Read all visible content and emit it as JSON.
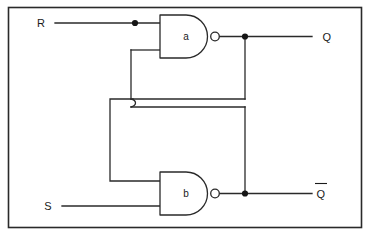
{
  "diagram": {
    "type": "logic-circuit-schematic",
    "colors": {
      "line": "#2a2a2a",
      "background": "#ffffff",
      "junction": "#151515",
      "text": "#1a1a1a"
    },
    "frame": {
      "x": 8,
      "y": 7,
      "width": 354,
      "height": 221
    },
    "labels": {
      "input_r": "R",
      "input_s": "S",
      "output_q": "Q",
      "output_qbar": "Q",
      "output_qbar_overbar": true,
      "gate_a": "a",
      "gate_b": "b"
    },
    "gates": [
      {
        "name": "a",
        "label": "a",
        "kind": "NAND",
        "body": {
          "x": 160,
          "y": 15,
          "width": 52,
          "height": 43
        },
        "bubble": {
          "cx": 215,
          "cy": 36.5,
          "r": 4.3
        },
        "inputs": [
          {
            "name": "gate-a-input-top",
            "y": 23
          },
          {
            "name": "gate-a-input-bottom",
            "y": 50
          }
        ],
        "output": {
          "x": 219,
          "y": 36.5
        }
      },
      {
        "name": "b",
        "label": "b",
        "kind": "NAND",
        "body": {
          "x": 160,
          "y": 172,
          "width": 52,
          "height": 43
        },
        "bubble": {
          "cx": 215,
          "cy": 193.5,
          "r": 4.3
        },
        "inputs": [
          {
            "name": "gate-b-input-top",
            "y": 181
          },
          {
            "name": "gate-b-input-bottom",
            "y": 206
          }
        ],
        "output": {
          "x": 219,
          "y": 193.5
        }
      }
    ],
    "junctions": [
      {
        "name": "junction-r-input",
        "cx": 135,
        "cy": 23,
        "r": 3.0
      },
      {
        "name": "junction-q-output",
        "cx": 245,
        "cy": 36.5,
        "r": 3.0
      },
      {
        "name": "junction-qbar-output",
        "cx": 245,
        "cy": 193.5,
        "r": 3.0
      }
    ],
    "wires": {
      "r_input_line": "M 55 23 L 160 23",
      "s_input_line": "M 62 206 L 160 206",
      "q_output_line": "M 219 36.5 L 310 36.5",
      "qbar_output_line": "M 219 193.5 L 310 193.5",
      "gate_a_lower_input_stub": "M 131 50 L 160 50",
      "gate_a_feedback_down": "M 131 50 L 131 99",
      "gate_a_feedback_jog": "M 131 99 L 135 103 L 131 107",
      "gate_a_feedback_to_right": "M 131 107 L 245 107",
      "qbar_feedback_up": "M 245 193.5 L 245 107",
      "q_feedback_down": "M 245 36.5 L 245 99",
      "q_feedback_left": "M 245 99 L 140 99",
      "crossover_left_line": "M 140 99 L 110 103 L 110 181 L 160 181",
      "note": "The two feedback paths cross near x=135,y=103 with a hop jog"
    },
    "text_positions": {
      "input_r": {
        "x": 41,
        "y": 27
      },
      "input_s": {
        "x": 48,
        "y": 210
      },
      "output_q": {
        "x": 327,
        "y": 40
      },
      "output_qbar": {
        "x": 321,
        "y": 198
      },
      "gate_a": {
        "x": 184,
        "y": 40
      },
      "gate_b": {
        "x": 184,
        "y": 197
      }
    }
  }
}
